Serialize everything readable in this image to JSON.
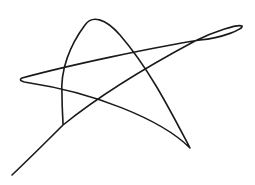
{
  "drawing": {
    "subject": "hand-drawn star sketch",
    "background": "#ffffff",
    "stroke_color": "#1a1a1a",
    "stroke_width": 1.6,
    "path": "M12,175 C30,158 48,140 63,125 C100,95 150,65 195,41 C215,31 238,24 242,26 C244,29 222,38 200,40 C150,48 70,65 22,78 C18,80 22,82 30,83 C90,92 160,118 190,148 C170,110 150,70 120,35 C105,18 92,15 85,25 C70,45 60,70 62,95 C62,110 63,118 63,125"
  }
}
